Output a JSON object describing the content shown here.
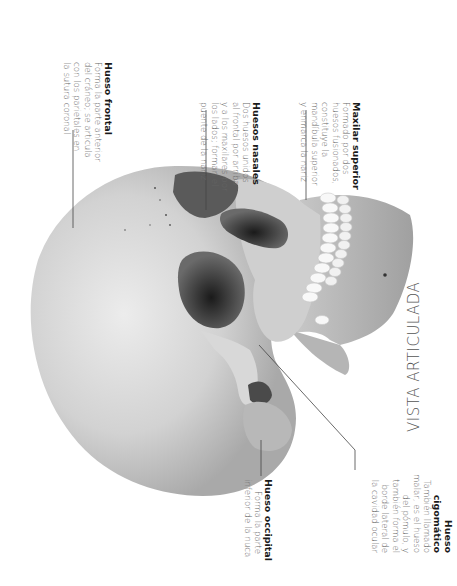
{
  "view_title": "VISTA ARTICULADA",
  "labels": {
    "frontal": {
      "title": "Hueso frontal",
      "lines": [
        "Forma la parte anterior",
        "del cráneo; se articula",
        "con los parietales en",
        "la sutura coronal"
      ]
    },
    "nasales": {
      "title": "Huesos nasales",
      "lines": [
        "Dos huesos unidos",
        "al frontal por arriba",
        "y a los maxilares por",
        "los lados; forman el",
        "puente de la nariz"
      ]
    },
    "maxilar": {
      "title": "Maxilar superior",
      "lines": [
        "Formado por dos",
        "huesos fusionados,",
        "constituye la",
        "mandíbula superior",
        "y enmarca la nariz"
      ]
    },
    "occipital": {
      "title": "Hueso occipital",
      "lines": [
        "Forma la parte",
        "inferior de la nuca"
      ]
    },
    "cigomatico": {
      "title_lines": [
        "Hueso",
        "cigomático"
      ],
      "lines": [
        "También llamado",
        "malar, es el hueso",
        "del pómulo, y",
        "también forma el",
        "borde lateral de",
        "la cavidad ocular"
      ]
    }
  },
  "colors": {
    "bone_light": "#e4e4e4",
    "bone_mid": "#bdbdbd",
    "bone_dark": "#8a8a8a",
    "cavity": "#3a3a3a",
    "teeth": "#f7f7f7",
    "leader": "#444444"
  }
}
